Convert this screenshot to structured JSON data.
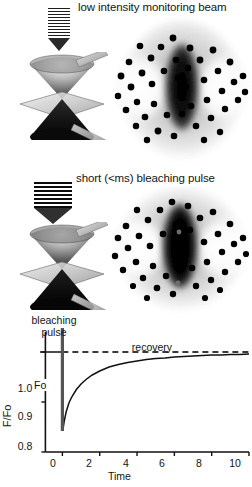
{
  "figure": {
    "panels": [
      {
        "id": "monitoring",
        "title": "low intensity monitoring beam",
        "beam_icon": "striped-down-arrow-icon",
        "optics_icon": "double-cone-focus-icon",
        "micrograph_icon": "cell-micrograph-unbleached-icon"
      },
      {
        "id": "bleaching",
        "title": "short (<ms) bleaching pulse",
        "beam_icon": "striped-down-arrow-bold-icon",
        "optics_icon": "double-cone-focus-icon",
        "micrograph_icon": "cell-micrograph-bleached-icon"
      }
    ]
  },
  "chart_labels": {
    "bleaching_pulse": "bleaching\npulse",
    "bleaching_pulse_line1": "bleaching",
    "bleaching_pulse_line2": "pulse",
    "recovery": "recovery",
    "fo": "Fo"
  },
  "chart_data": {
    "type": "line",
    "title": "",
    "xlabel": "Time",
    "ylabel": "F/Fo",
    "xlim": [
      -1.2,
      10
    ],
    "ylim": [
      0.8,
      1.04
    ],
    "xticks": [
      0,
      2,
      4,
      6,
      8,
      10
    ],
    "xticklabels": [
      "0",
      "2",
      "4",
      "6",
      "8",
      "10"
    ],
    "yticks": [
      0.8,
      0.9,
      1.0
    ],
    "yticklabels": [
      "0.8",
      "0.9",
      "1.0"
    ],
    "grid": false,
    "legend": null,
    "annotations": [
      {
        "name": "bleaching-pulse-marker",
        "text": "bleaching pulse",
        "x": 0,
        "type": "vertical-bar",
        "color": "#555555"
      },
      {
        "name": "prebleach-level",
        "text": "Fo",
        "y": 1.0,
        "type": "dashed-reference-line",
        "color": "#3a3a3a"
      },
      {
        "name": "recovery-phase",
        "text": "recovery",
        "x": 4.5
      }
    ],
    "series": [
      {
        "name": "prebleach baseline",
        "style": "solid",
        "color": "#111111",
        "x": [
          -1.2,
          -0.05
        ],
        "values": [
          1.0,
          1.0
        ]
      },
      {
        "name": "F/Fo recovery curve",
        "style": "solid",
        "color": "#111111",
        "x": [
          0.02,
          0.1,
          0.2,
          0.35,
          0.5,
          0.75,
          1.0,
          1.3,
          1.6,
          2.0,
          2.5,
          3.0,
          3.5,
          4.0,
          4.5,
          5.0,
          5.5,
          6.0,
          6.5,
          7.0,
          7.5,
          8.0,
          8.5,
          9.0,
          9.5,
          10.0
        ],
        "values": [
          0.842,
          0.862,
          0.88,
          0.898,
          0.91,
          0.925,
          0.936,
          0.946,
          0.954,
          0.962,
          0.97,
          0.975,
          0.979,
          0.982,
          0.985,
          0.987,
          0.988,
          0.99,
          0.991,
          0.992,
          0.993,
          0.994,
          0.994,
          0.995,
          0.995,
          0.996
        ]
      },
      {
        "name": "Fo reference (dashed)",
        "style": "dashed",
        "color": "#3a3a3a",
        "x": [
          0.0,
          10.0
        ],
        "values": [
          1.0,
          1.0
        ]
      }
    ]
  },
  "colors": {
    "ink": "#111111",
    "axis": "#111111",
    "dashed_reference": "#3a3a3a",
    "pulse_bar": "#555555",
    "background": "#ffffff"
  }
}
